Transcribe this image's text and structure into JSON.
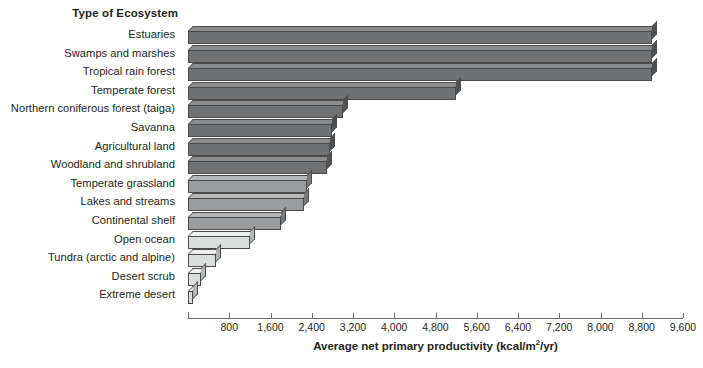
{
  "category_axis_title": "Type of Ecosystem",
  "value_axis_title_prefix": "Average net primary productivity (kcal/m",
  "value_axis_title_exponent": "2",
  "value_axis_title_suffix": "/yr)",
  "colors": {
    "bar_dark": "#6f7173",
    "bar_dark_top": "#8a8c8e",
    "bar_dark_side": "#4f5153",
    "bar_light": "#dcdddd",
    "bar_light_top": "#eeefef",
    "bar_light_side": "#b4b5b6",
    "bar_mid": "#9a9c9e",
    "bar_mid_top": "#b5b7b8",
    "bar_mid_side": "#77797b",
    "axis": "#6d6e71",
    "text": "#231f20"
  },
  "chart_data": {
    "type": "bar",
    "orientation": "horizontal",
    "title": "",
    "xlabel": "Average net primary productivity (kcal/m2/yr)",
    "ylabel": "Type of Ecosystem",
    "xlim": [
      0,
      9600
    ],
    "xticks": [
      800,
      1600,
      2400,
      3200,
      4000,
      4800,
      5600,
      6400,
      7200,
      8000,
      8800,
      9600
    ],
    "xticklabels": [
      "800",
      "1,600",
      "2,400",
      "3,200",
      "4,000",
      "4,800",
      "5,600",
      "6,400",
      "7,200",
      "8,000",
      "8,800",
      "9,600"
    ],
    "grid": false,
    "legend": "none",
    "categories": [
      "Estuaries",
      "Swamps and marshes",
      "Tropical rain forest",
      "Temperate forest",
      "Northern coniferous forest (taiga)",
      "Savanna",
      "Agricultural land",
      "Woodland and shrubland",
      "Temperate grassland",
      "Lakes and streams",
      "Continental shelf",
      "Open ocean",
      "Tundra (arctic and alpine)",
      "Desert scrub",
      "Extreme desert"
    ],
    "values": [
      9000,
      9000,
      9000,
      5200,
      3000,
      2800,
      2750,
      2700,
      2300,
      2250,
      1800,
      1200,
      550,
      250,
      100
    ],
    "bars": [
      {
        "label": "Estuaries",
        "value": 9000,
        "shade": "dark"
      },
      {
        "label": "Swamps and marshes",
        "value": 9000,
        "shade": "dark"
      },
      {
        "label": "Tropical rain forest",
        "value": 9000,
        "shade": "dark"
      },
      {
        "label": "Temperate forest",
        "value": 5200,
        "shade": "dark"
      },
      {
        "label": "Northern coniferous forest (taiga)",
        "value": 3000,
        "shade": "dark"
      },
      {
        "label": "Savanna",
        "value": 2800,
        "shade": "dark"
      },
      {
        "label": "Agricultural land",
        "value": 2750,
        "shade": "dark"
      },
      {
        "label": "Woodland and shrubland",
        "value": 2700,
        "shade": "dark"
      },
      {
        "label": "Temperate grassland",
        "value": 2300,
        "shade": "mid"
      },
      {
        "label": "Lakes and streams",
        "value": 2250,
        "shade": "mid"
      },
      {
        "label": "Continental shelf",
        "value": 1800,
        "shade": "mid"
      },
      {
        "label": "Open ocean",
        "value": 1200,
        "shade": "light"
      },
      {
        "label": "Tundra (arctic and alpine)",
        "value": 550,
        "shade": "light"
      },
      {
        "label": "Desert scrub",
        "value": 250,
        "shade": "light"
      },
      {
        "label": "Extreme desert",
        "value": 100,
        "shade": "light"
      }
    ]
  }
}
